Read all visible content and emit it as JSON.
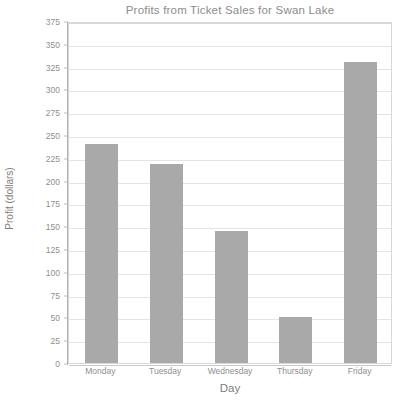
{
  "chart_data": {
    "type": "bar",
    "title": "Profits from Ticket Sales for Swan Lake",
    "xlabel": "Day",
    "ylabel": "Profit (dollars)",
    "categories": [
      "Monday",
      "Tuesday",
      "Wednesday",
      "Thursday",
      "Friday"
    ],
    "values": [
      240,
      218,
      145,
      50,
      330
    ],
    "ylim": [
      0,
      375
    ],
    "ytick_step": 25,
    "yticks": [
      375,
      350,
      325,
      300,
      275,
      250,
      225,
      200,
      175,
      150,
      125,
      100,
      75,
      50,
      25,
      0
    ],
    "ytick_labels": [
      "375",
      "350",
      "325",
      "300",
      "275",
      "250",
      "225",
      "200",
      "175",
      "150",
      "125",
      "100",
      "75",
      "50",
      "25",
      "0"
    ],
    "grid": true,
    "legend": false,
    "legend_position": "none",
    "series": [
      {
        "name": "Profit",
        "values": [
          240,
          218,
          145,
          50,
          330
        ]
      }
    ],
    "colors": {
      "bar_fill": "#a9a9a9",
      "gridline": "#e4e4e4",
      "axis_line": "#b0b0b0",
      "plot_border": "#d8d8d8",
      "title_text": "#8c8c8c",
      "tick_text": "#8f8f8f",
      "axis_title_text": "#7e7e7e",
      "background": "#ffffff"
    }
  }
}
